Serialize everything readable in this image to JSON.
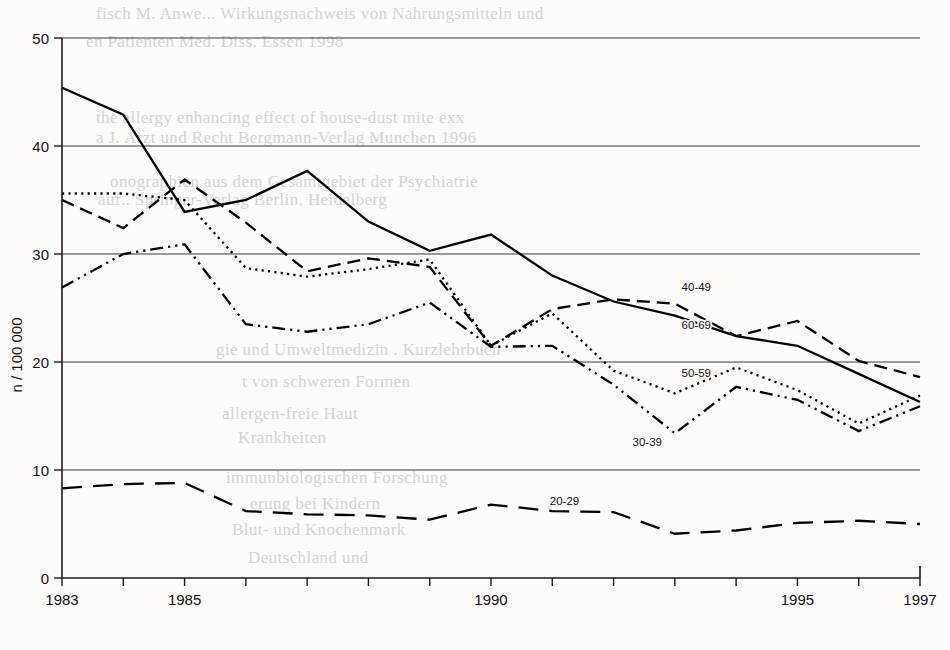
{
  "chart_data": {
    "type": "line",
    "title": "",
    "subtitle": "",
    "xlabel": "",
    "ylabel": "n / 100 000",
    "xlim": [
      1983,
      1997
    ],
    "ylim": [
      0,
      50
    ],
    "ytick_step": 10,
    "yticks": [
      0,
      10,
      20,
      30,
      40,
      50
    ],
    "xticks": [
      1983,
      1984,
      1985,
      1986,
      1987,
      1988,
      1989,
      1990,
      1991,
      1992,
      1993,
      1994,
      1995,
      1996,
      1997
    ],
    "xtick_labels_shown": [
      "1983",
      "1985",
      "1990",
      "1995",
      "1997"
    ],
    "grid": "horizontal",
    "legend": "inline-right-labels",
    "x": [
      1983,
      1984,
      1985,
      1986,
      1987,
      1988,
      1989,
      1990,
      1991,
      1992,
      1993,
      1994,
      1995,
      1996,
      1997
    ],
    "series": [
      {
        "name": "40-49",
        "label": "40-49",
        "style": "solid",
        "values": [
          45.4,
          42.9,
          33.9,
          35.0,
          37.7,
          33.0,
          30.3,
          31.8,
          28.0,
          25.6,
          24.3,
          22.4,
          21.5,
          18.9,
          16.3
        ]
      },
      {
        "name": "60-69",
        "label": "60-69",
        "style": "dashed",
        "values": [
          35.0,
          32.4,
          36.9,
          32.9,
          28.4,
          29.6,
          28.8,
          21.5,
          24.9,
          25.8,
          25.4,
          22.4,
          23.8,
          20.1,
          18.6
        ]
      },
      {
        "name": "50-59",
        "label": "50-59",
        "style": "dotted",
        "values": [
          35.6,
          35.6,
          35.0,
          28.7,
          27.9,
          28.6,
          29.5,
          21.5,
          24.5,
          19.2,
          17.1,
          19.5,
          17.4,
          14.3,
          16.9
        ]
      },
      {
        "name": "30-39",
        "label": "30-39",
        "style": "dash-dot-dot",
        "values": [
          26.9,
          30.0,
          30.9,
          23.5,
          22.8,
          23.5,
          25.5,
          21.4,
          21.5,
          17.9,
          13.4,
          17.7,
          16.5,
          13.6,
          15.9
        ]
      },
      {
        "name": "20-29",
        "label": "20-29",
        "style": "long-dash",
        "values": [
          8.3,
          8.7,
          8.8,
          6.2,
          5.9,
          5.8,
          5.4,
          6.8,
          6.2,
          6.1,
          4.1,
          4.4,
          5.1,
          5.3,
          5.0
        ]
      }
    ],
    "series_label_positions": [
      {
        "label": "40-49",
        "x": 1993.35,
        "y": 26.6
      },
      {
        "label": "60-69",
        "x": 1993.35,
        "y": 23.1
      },
      {
        "label": "50-59",
        "x": 1993.35,
        "y": 18.6
      },
      {
        "label": "30-39",
        "x": 1992.55,
        "y": 12.2
      },
      {
        "label": "20-29",
        "x": 1991.2,
        "y": 6.8
      }
    ]
  },
  "background_text": {
    "note": "faint bleed-through text from reverse of printed page",
    "lines": [
      {
        "text": "fisch M. Anwe... Wirkungsnachweis von Nahrungsmitteln und",
        "x": 96,
        "y": 4
      },
      {
        "text": "en Patienten Med. Diss. Essen 1998",
        "x": 86,
        "y": 32
      },
      {
        "text": "the allergy enhancing effect of house-dust mite exx",
        "x": 96,
        "y": 108
      },
      {
        "text": "a J. Arzt und Recht Bergmann-Verlag Munchen 1996",
        "x": 96,
        "y": 128
      },
      {
        "text": "onographien aus dem Gesamtgebiet der Psychiatrie",
        "x": 110,
        "y": 172
      },
      {
        "text": "auf.. Springer-Verlag Berlin, Heidelberg",
        "x": 98,
        "y": 190
      },
      {
        "text": "gie und Umweltmedizin . Kurzlehrbuch",
        "x": 216,
        "y": 340
      },
      {
        "text": "t von schweren Formen",
        "x": 242,
        "y": 372
      },
      {
        "text": "allergen-freie Haut",
        "x": 222,
        "y": 404
      },
      {
        "text": "Krankheiten",
        "x": 238,
        "y": 428
      },
      {
        "text": "immunbiologischen Forschung",
        "x": 226,
        "y": 468
      },
      {
        "text": "erung bei Kindern",
        "x": 250,
        "y": 494
      },
      {
        "text": "Blut- und Knochenmark",
        "x": 232,
        "y": 520
      },
      {
        "text": "Deutschland und",
        "x": 248,
        "y": 548
      }
    ]
  }
}
